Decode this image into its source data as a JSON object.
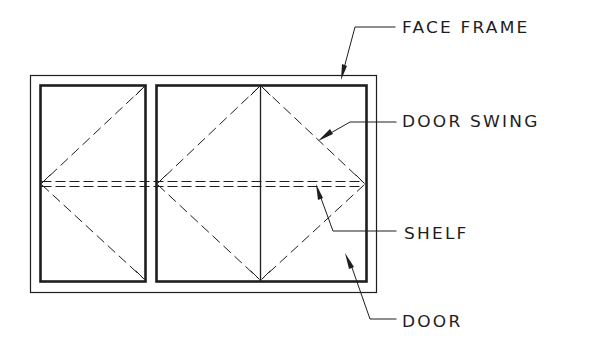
{
  "diagram": {
    "colors": {
      "ink": "#1e1e1e",
      "background": "#ffffff"
    },
    "labels": [
      {
        "id": "face-frame",
        "text": "FACE FRAME"
      },
      {
        "id": "door-swing",
        "text": "DOOR SWING"
      },
      {
        "id": "shelf",
        "text": "SHELF"
      },
      {
        "id": "door",
        "text": "DOOR"
      }
    ],
    "components": {
      "face_frame": "outer thin rectangle",
      "doors": [
        "left door (single swing)",
        "right pair of doors (double swing)"
      ],
      "shelf": "horizontal double dashed line",
      "door_swing": "dashed diagonal lines indicating hinge side"
    }
  }
}
